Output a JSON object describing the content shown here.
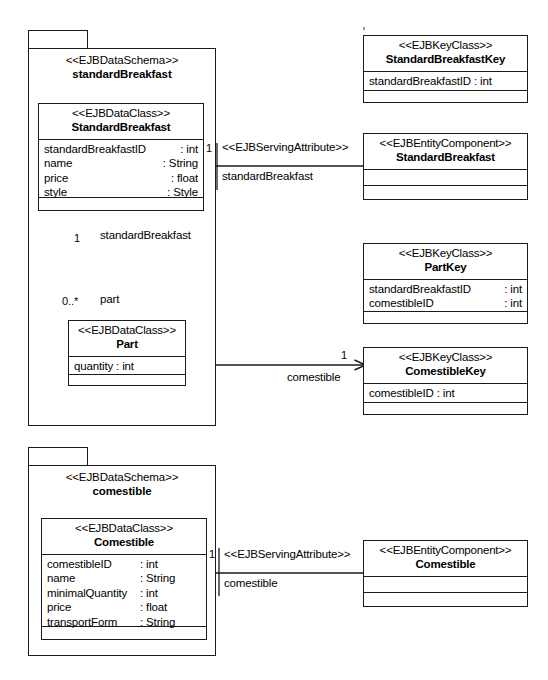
{
  "diagram": {
    "stereotypes": {
      "data_schema": "<<EJBDataSchema>>",
      "data_class": "<<EJBDataClass>>",
      "key_class": "<<EJBKeyClass>>",
      "entity_component": "<<EJBEntityComponent>>",
      "serving_attribute": "<<EJBServingAttribute>>"
    },
    "colors": {
      "stroke": "#1a1a1a",
      "fill": "#ffffff",
      "text": "#000000"
    }
  },
  "packages": [
    {
      "id": "pkg-standard-breakfast",
      "stereotype": "<<EJBDataSchema>>",
      "name": "standardBreakfast"
    },
    {
      "id": "pkg-comestible",
      "stereotype": "<<EJBDataSchema>>",
      "name": "comestible"
    }
  ],
  "classes": {
    "standard_breakfast_data": {
      "stereotype": "<<EJBDataClass>>",
      "name": "StandardBreakfast",
      "attributes": [
        {
          "name": "standardBreakfastID",
          "type": ": int"
        },
        {
          "name": "name",
          "type": ": String"
        },
        {
          "name": "price",
          "type": ": float"
        },
        {
          "name": "style",
          "type": ": Style"
        }
      ],
      "operations": []
    },
    "part_data": {
      "stereotype": "<<EJBDataClass>>",
      "name": "Part",
      "attributes": [
        {
          "name": "quantity : int",
          "type": ""
        }
      ],
      "operations": []
    },
    "comestible_data": {
      "stereotype": "<<EJBDataClass>>",
      "name": "Comestible",
      "attributes": [
        {
          "name": "comestibleID",
          "type": ": int"
        },
        {
          "name": "name",
          "type": ": String"
        },
        {
          "name": "minimalQuantity",
          "type": ": int"
        },
        {
          "name": "price",
          "type": ": float"
        },
        {
          "name": "transportForm",
          "type": ": String"
        }
      ],
      "operations": []
    },
    "standard_breakfast_key": {
      "stereotype": "<<EJBKeyClass>>",
      "name": "StandardBreakfastKey",
      "attributes": [
        {
          "name": "standardBreakfastID : int",
          "type": ""
        }
      ],
      "operations": []
    },
    "part_key": {
      "stereotype": "<<EJBKeyClass>>",
      "name": "PartKey",
      "attributes": [
        {
          "name": "standardBreakfastID",
          "type": ": int"
        },
        {
          "name": "comestibleID",
          "type": ": int"
        }
      ],
      "operations": []
    },
    "comestible_key": {
      "stereotype": "<<EJBKeyClass>>",
      "name": "ComestibleKey",
      "attributes": [
        {
          "name": "comestibleID : int",
          "type": ""
        }
      ],
      "operations": []
    },
    "standard_breakfast_component": {
      "stereotype": "<<EJBEntityComponent>>",
      "name": "StandardBreakfast",
      "attributes": [],
      "operations": []
    },
    "comestible_component": {
      "stereotype": "<<EJBEntityComponent>>",
      "name": "Comestible",
      "attributes": [],
      "operations": []
    }
  },
  "relationships": {
    "serving_attribute_breakfast": {
      "stereotype": "<<EJBServingAttribute>>",
      "role": "standardBreakfast",
      "multiplicity": "1"
    },
    "composition_part": {
      "whole_multiplicity": "1",
      "whole_role": "standardBreakfast",
      "part_multiplicity": "0..*",
      "part_role": "part"
    },
    "part_comestible": {
      "multiplicity": "1",
      "role": "comestible"
    },
    "serving_attribute_comestible": {
      "stereotype": "<<EJBServingAttribute>>",
      "role": "comestible",
      "multiplicity": "1"
    }
  }
}
